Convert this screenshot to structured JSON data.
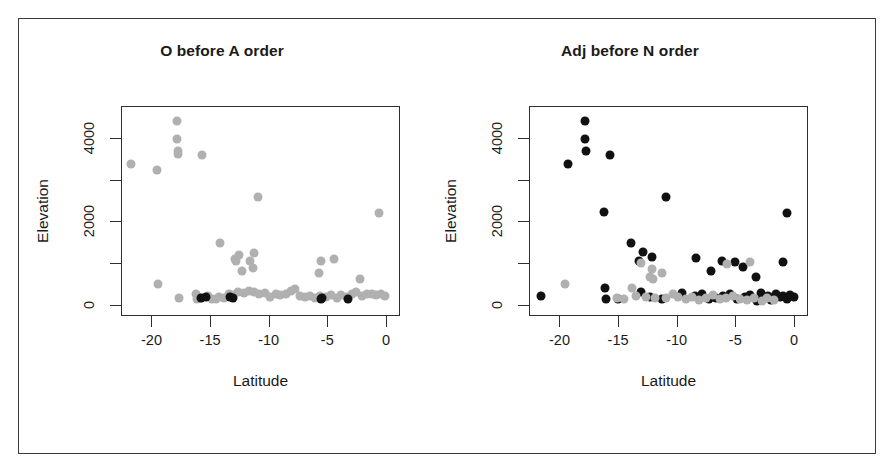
{
  "figure": {
    "background": "#ffffff",
    "frame_color": "#3b3b3b",
    "point_color_grey": "#b0b0b0",
    "point_color_black": "#111111"
  },
  "chart_data": [
    {
      "type": "scatter",
      "title": "O before A order",
      "xlabel": "Latitude",
      "ylabel": "Elevation",
      "xlim": [
        -22.6,
        1.2
      ],
      "ylim": [
        -260,
        4760
      ],
      "xticks": [
        -20,
        -15,
        -10,
        -5,
        0
      ],
      "xticklabels": [
        "-20",
        "-15",
        "-10",
        "-5",
        "0"
      ],
      "yticks": [
        0,
        1000,
        2000,
        3000,
        4000
      ],
      "yticklabels": [
        "0",
        "",
        "2000",
        "",
        "4000"
      ],
      "grid": false,
      "legend": "none",
      "series": [
        {
          "name": "grey",
          "color": "#b0b0b0",
          "points": [
            [
              -21.8,
              3400
            ],
            [
              -19.6,
              3250
            ],
            [
              -17.9,
              4420
            ],
            [
              -17.9,
              4000
            ],
            [
              -17.8,
              3720
            ],
            [
              -17.8,
              3640
            ],
            [
              -15.8,
              3620
            ],
            [
              -11.0,
              2620
            ],
            [
              -0.7,
              2220
            ],
            [
              -14.2,
              1520
            ],
            [
              -12.6,
              1230
            ],
            [
              -13.0,
              1120
            ],
            [
              -12.9,
              1080
            ],
            [
              -12.4,
              850
            ],
            [
              -11.7,
              1080
            ],
            [
              -11.4,
              920
            ],
            [
              -11.3,
              1260
            ],
            [
              -5.6,
              1080
            ],
            [
              -4.5,
              1130
            ],
            [
              -5.8,
              790
            ],
            [
              -19.5,
              540
            ],
            [
              -2.3,
              640
            ],
            [
              -17.7,
              200
            ],
            [
              -16.3,
              290
            ],
            [
              -16.2,
              170
            ],
            [
              -15.9,
              200
            ],
            [
              -15.3,
              250
            ],
            [
              -14.9,
              180
            ],
            [
              -14.6,
              160
            ],
            [
              -14.3,
              230
            ],
            [
              -13.9,
              200
            ],
            [
              -13.5,
              300
            ],
            [
              -13.2,
              260
            ],
            [
              -12.7,
              330
            ],
            [
              -12.2,
              310
            ],
            [
              -11.8,
              350
            ],
            [
              -11.3,
              330
            ],
            [
              -10.9,
              300
            ],
            [
              -10.4,
              320
            ],
            [
              -10.0,
              230
            ],
            [
              -9.5,
              290
            ],
            [
              -9.1,
              260
            ],
            [
              -8.6,
              300
            ],
            [
              -8.2,
              370
            ],
            [
              -7.8,
              420
            ],
            [
              -7.4,
              250
            ],
            [
              -7.0,
              210
            ],
            [
              -6.6,
              250
            ],
            [
              -6.1,
              200
            ],
            [
              -5.7,
              250
            ],
            [
              -5.2,
              230
            ],
            [
              -4.8,
              260
            ],
            [
              -4.3,
              200
            ],
            [
              -3.9,
              260
            ],
            [
              -3.4,
              210
            ],
            [
              -3.0,
              290
            ],
            [
              -2.6,
              330
            ],
            [
              -2.1,
              240
            ],
            [
              -1.7,
              280
            ],
            [
              -1.3,
              300
            ],
            [
              -0.9,
              270
            ],
            [
              -0.5,
              300
            ],
            [
              -0.2,
              250
            ]
          ]
        },
        {
          "name": "black",
          "color": "#111111",
          "points": [
            [
              -15.9,
              195
            ],
            [
              -15.4,
              215
            ],
            [
              -13.4,
              215
            ],
            [
              -13.1,
              200
            ],
            [
              -5.6,
              180
            ],
            [
              -5.5,
              195
            ],
            [
              -3.3,
              170
            ]
          ]
        }
      ]
    },
    {
      "type": "scatter",
      "title": "Adj before N order",
      "xlabel": "Latitude",
      "ylabel": "Elevation",
      "xlim": [
        -22.6,
        1.2
      ],
      "ylim": [
        -260,
        4760
      ],
      "xticks": [
        -20,
        -15,
        -10,
        -5,
        0
      ],
      "xticklabels": [
        "-20",
        "-15",
        "-10",
        "-5",
        "0"
      ],
      "yticks": [
        0,
        1000,
        2000,
        3000,
        4000
      ],
      "yticklabels": [
        "0",
        "",
        "2000",
        "",
        "4000"
      ],
      "grid": false,
      "legend": "none",
      "series": [
        {
          "name": "black",
          "color": "#111111",
          "points": [
            [
              -17.9,
              4420
            ],
            [
              -17.9,
              4000
            ],
            [
              -17.8,
              3720
            ],
            [
              -19.4,
              3400
            ],
            [
              -15.8,
              3620
            ],
            [
              -11.0,
              2620
            ],
            [
              -16.3,
              2250
            ],
            [
              -14.0,
              1520
            ],
            [
              -13.0,
              1290
            ],
            [
              -12.2,
              1180
            ],
            [
              -13.3,
              1080
            ],
            [
              -8.4,
              1140
            ],
            [
              -7.2,
              850
            ],
            [
              -6.2,
              1080
            ],
            [
              -5.1,
              1050
            ],
            [
              -4.4,
              930
            ],
            [
              -3.3,
              700
            ],
            [
              -1.0,
              1050
            ],
            [
              -0.7,
              2220
            ],
            [
              -21.7,
              250
            ],
            [
              -16.2,
              430
            ],
            [
              -16.1,
              160
            ],
            [
              -15.1,
              160
            ],
            [
              -13.1,
              330
            ],
            [
              -12.4,
              210
            ],
            [
              -11.3,
              180
            ],
            [
              -9.6,
              310
            ],
            [
              -8.5,
              240
            ],
            [
              -7.9,
              280
            ],
            [
              -7.3,
              170
            ],
            [
              -6.7,
              190
            ],
            [
              -6.1,
              250
            ],
            [
              -5.5,
              300
            ],
            [
              -4.9,
              180
            ],
            [
              -4.3,
              220
            ],
            [
              -3.8,
              260
            ],
            [
              -3.2,
              130
            ],
            [
              -2.7,
              180
            ],
            [
              -2.3,
              250
            ],
            [
              -1.9,
              200
            ],
            [
              -1.6,
              290
            ],
            [
              -1.3,
              220
            ],
            [
              -1.0,
              250
            ],
            [
              -0.7,
              180
            ],
            [
              -0.4,
              260
            ],
            [
              -0.1,
              230
            ],
            [
              -2.9,
              320
            ],
            [
              -2.0,
              150
            ]
          ]
        },
        {
          "name": "grey",
          "color": "#b0b0b0",
          "points": [
            [
              -19.6,
              540
            ],
            [
              -13.1,
              1020
            ],
            [
              -12.2,
              880
            ],
            [
              -12.4,
              700
            ],
            [
              -12.1,
              640
            ],
            [
              -11.3,
              780
            ],
            [
              -5.8,
              1000
            ],
            [
              -3.8,
              1060
            ],
            [
              -15.2,
              200
            ],
            [
              -14.6,
              170
            ],
            [
              -13.6,
              250
            ],
            [
              -12.7,
              230
            ],
            [
              -11.9,
              190
            ],
            [
              -11.0,
              200
            ],
            [
              -10.4,
              300
            ],
            [
              -10.0,
              220
            ],
            [
              -9.3,
              180
            ],
            [
              -8.8,
              230
            ],
            [
              -8.2,
              150
            ],
            [
              -7.6,
              200
            ],
            [
              -7.0,
              260
            ],
            [
              -6.4,
              170
            ],
            [
              -5.9,
              200
            ],
            [
              -5.3,
              240
            ],
            [
              -4.7,
              170
            ],
            [
              -4.1,
              150
            ],
            [
              -3.5,
              190
            ],
            [
              -2.8,
              120
            ],
            [
              -2.4,
              200
            ],
            [
              -1.8,
              150
            ],
            [
              -13.9,
              430
            ]
          ]
        }
      ]
    }
  ]
}
